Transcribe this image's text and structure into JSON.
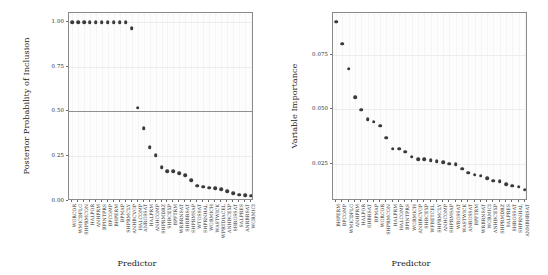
{
  "chart_data": [
    {
      "type": "scatter",
      "panel": "left",
      "title": "",
      "xlabel": "Predictor",
      "ylabel": "Posterior Probability of Inclusion",
      "ylim": [
        0.0,
        1.05
      ],
      "yticks": [
        0.0,
        0.25,
        0.5,
        0.75,
        1.0
      ],
      "ytick_labels": [
        "0.00",
        "0.25",
        "0.50",
        "0.75",
        "1.00"
      ],
      "grid": true,
      "legend": "none",
      "reference_line": {
        "y": 0.5,
        "orientation": "horizontal",
        "color": "#8f8f8f"
      },
      "categories": [
        "WGRCOR",
        "WMICDFLG",
        "SHPRMCON",
        "HALPOR",
        "ANHPRM",
        "BPINTPRS",
        "BPCOMP",
        "BHPERM",
        "BPMAP",
        "SHPRMCLY",
        "ANHBCVGP",
        "HALCOMP",
        "ANRGSSAT",
        "HALPRM",
        "ANHCOMP",
        "SHPRMDRZ",
        "SHBCEXP",
        "BPFTRM",
        "WRBRNSAT",
        "SHRBRSAT",
        "SHPRMSAP",
        "WTGSSAT",
        "SHPRNHAL",
        "WGRMICH",
        "WASTWICK",
        "WPRTDIACEL",
        "ANHBCEXP",
        "SHRGSSAT",
        "SALPRES",
        "ANRBRSAT",
        "WGRMICI"
      ],
      "values": [
        1.0,
        1.0,
        1.0,
        1.0,
        1.0,
        1.0,
        1.0,
        1.0,
        1.0,
        1.0,
        0.965,
        0.52,
        0.405,
        0.3,
        0.255,
        0.19,
        0.165,
        0.165,
        0.155,
        0.145,
        0.115,
        0.085,
        0.08,
        0.075,
        0.07,
        0.065,
        0.055,
        0.045,
        0.035,
        0.032,
        0.03
      ]
    },
    {
      "type": "scatter",
      "panel": "right",
      "title": "",
      "xlabel": "Predictor",
      "ylabel": "Variable Importance",
      "ylim": [
        0.008,
        0.094
      ],
      "yticks": [
        0.025,
        0.05,
        0.075
      ],
      "ytick_labels": [
        "0.025",
        "0.050",
        "0.075"
      ],
      "grid": true,
      "legend": "none",
      "categories": [
        "BHPERM",
        "BPCOMP",
        "WMICDFLG",
        "ANHPRM",
        "HALPOR",
        "SHBRSAT",
        "BPMAP",
        "WGRCOR",
        "SHPRMCON",
        "HALPRM",
        "HALCOMP",
        "BPINTPRS",
        "WGRMICH",
        "ANHBCVGP",
        "SHBCEXP",
        "WFBETCEL",
        "SHPRMCLY",
        "ANHCOMP",
        "SHPRMSAP",
        "WRGSSAT",
        "WASTWICK",
        "ANRGSSAT",
        "BPFTRM",
        "WRBRNSAT",
        "WGRMICI",
        "ANHBCEXP",
        "SHPRMDRZ",
        "SALPRES",
        "SHRGSSAT",
        "SHPRNHAL",
        "ANHBHRSAT"
      ],
      "values": [
        0.09,
        0.08,
        0.0685,
        0.0555,
        0.0497,
        0.0455,
        0.0443,
        0.0425,
        0.037,
        0.032,
        0.032,
        0.0305,
        0.0283,
        0.0272,
        0.027,
        0.0266,
        0.0262,
        0.0258,
        0.025,
        0.0248,
        0.0228,
        0.021,
        0.02,
        0.0195,
        0.0185,
        0.0172,
        0.017,
        0.0158,
        0.015,
        0.0145,
        0.0132
      ]
    }
  ]
}
